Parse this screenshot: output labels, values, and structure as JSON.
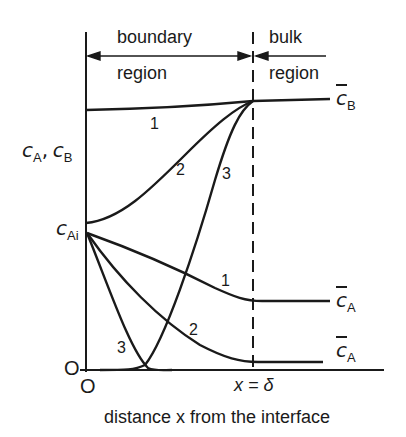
{
  "diagram": {
    "regions": {
      "boundary_line1": "boundary",
      "boundary_line2": "region",
      "bulk_line1": "bulk",
      "bulk_line2": "region"
    },
    "axes": {
      "y_label_var1": "c",
      "y_label_sub1": "A",
      "y_label_sep": ",",
      "y_label_var2": "c",
      "y_label_sub2": "B",
      "y_zero": "O",
      "x_zero": "O",
      "x_label": "distance x from the interface",
      "delta_label": "x = δ"
    },
    "markers": {
      "c_ai_var": "c",
      "c_ai_sub": "Ai",
      "cb_bar_var": "c",
      "cb_bar_sub": "B",
      "ca_bar1_var": "c",
      "ca_bar1_sub": "A",
      "ca_bar2_var": "c",
      "ca_bar2_sub": "A"
    },
    "curve_labels": {
      "b1": "1",
      "b2": "2",
      "b3": "3",
      "a1": "1",
      "a2": "2",
      "a3": "3"
    },
    "colors": {
      "ink": "#1a1a1a",
      "background": "#ffffff"
    }
  }
}
